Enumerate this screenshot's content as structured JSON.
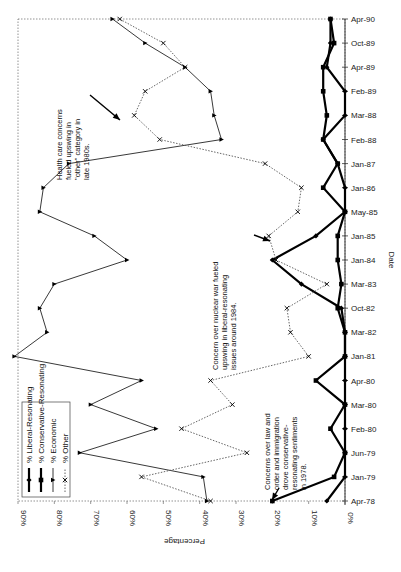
{
  "chart_data": {
    "type": "line",
    "orientation": "rotated-90-clockwise",
    "title": "",
    "xlabel": "Date",
    "ylabel": "Percentage",
    "ylim": [
      0,
      90
    ],
    "yticks": [
      "0%",
      "10%",
      "20%",
      "30%",
      "40%",
      "50%",
      "60%",
      "70%",
      "80%",
      "90%"
    ],
    "grid": false,
    "legend_position": "lower-left (rotated)",
    "categories": [
      "Apr-78",
      "Jan-79",
      "Jun-79",
      "Feb-80",
      "Mar-80",
      "Apr-80",
      "Jan-81",
      "Mar-82",
      "Oct-82",
      "Mar-83",
      "Jan-84",
      "Jan-85",
      "May-85",
      "Jan-86",
      "Jan-87",
      "Feb-88",
      "Mar-88",
      "Feb-89",
      "Apr-89",
      "Oct-89",
      "Apr-90"
    ],
    "series": [
      {
        "name": "% Liberal-Resonating",
        "style": "thick-solid",
        "marker": "diamond",
        "values": [
          5,
          0,
          0,
          0,
          0,
          0,
          0,
          0,
          1,
          12,
          20,
          8,
          0,
          0,
          2,
          6,
          0,
          0,
          5,
          4,
          4
        ]
      },
      {
        "name": "% Conservative-Resonating",
        "style": "thick-solid",
        "marker": "square",
        "values": [
          20,
          3,
          0,
          4,
          0,
          8,
          0,
          0,
          2,
          1,
          2,
          2,
          0,
          6,
          2,
          6,
          5,
          6,
          6,
          3,
          4
        ]
      },
      {
        "name": "% Economic",
        "style": "thin-solid",
        "marker": "triangle",
        "values": [
          38,
          39,
          73,
          52,
          70,
          56,
          91,
          82,
          84,
          80,
          60,
          69,
          84,
          83,
          76,
          34,
          36,
          37,
          44,
          55,
          64
        ]
      },
      {
        "name": "% Other",
        "style": "dotted",
        "marker": "x",
        "values": [
          37,
          56,
          27,
          45,
          31,
          37,
          10,
          15,
          16,
          5,
          19,
          21,
          13,
          12,
          22,
          51,
          58,
          55,
          44,
          50,
          62
        ]
      }
    ],
    "annotations": [
      {
        "text": "Concerns over law and order and immigration drove conservative-resonating sentiments in 1978.",
        "target": "Apr-78"
      },
      {
        "text": "Concern over nuclear war fueled upswing in liberal-resonating issues around 1984.",
        "target": "Jan-84"
      },
      {
        "text": "Health care concerns fueled upswing in \"other\" category in late 1980s.",
        "target": "Mar-88"
      }
    ]
  },
  "axis": {
    "x_title": "Percentage",
    "y_title": "Date"
  },
  "legend": {
    "items": [
      "% Liberal-Resonating",
      "% Conservative-Resonating",
      "% Economic",
      "% Other"
    ]
  },
  "annotations": {
    "law_order_lines": [
      "Concerns over law and",
      "order and immigration",
      "drove conservative-",
      "resonating sentiments",
      "in 1978."
    ],
    "nuclear_lines": [
      "Concern over nuclear war fueled",
      "upswing in liberal-resonating",
      "issues around 1984."
    ],
    "health_lines": [
      "Health care concerns",
      "fueled upswing in",
      "\"other\" category in",
      "late 1980s."
    ]
  }
}
